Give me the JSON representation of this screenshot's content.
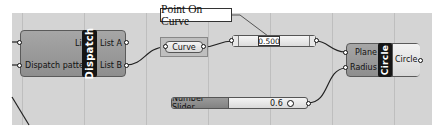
{
  "canvas": {
    "background": "#d4d4d4"
  },
  "dispatch": {
    "nickname": "Dispatch",
    "inputs": [
      "List",
      "Dispatch pattern"
    ],
    "outputs": [
      "List A",
      "List B"
    ]
  },
  "curve_param": {
    "label": "Curve"
  },
  "point_on_curve": {
    "callout": "Point On Curve",
    "value": "0.500"
  },
  "circle": {
    "nickname": "Circle",
    "inputs": [
      "Plane",
      "Radius"
    ],
    "outputs": [
      "Circle"
    ]
  },
  "number_slider": {
    "label": "Number Slider",
    "value": "0.6"
  },
  "icons": {
    "port": "grip-circle",
    "slider_knob": "ring-knob"
  }
}
